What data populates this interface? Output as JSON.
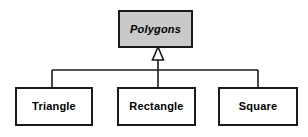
{
  "diagram": {
    "kind": "uml-class-hierarchy",
    "relationship": "generalization",
    "canvas": {
      "width": 308,
      "height": 137,
      "background": "#ffffff"
    },
    "colors": {
      "line": "#1a1a1a",
      "border": "#1a1a1a",
      "superclass_fill": "#c9c9c9",
      "subclass_fill": "#ffffff",
      "arrowhead_fill": "#ffffff",
      "text": "#000000"
    },
    "superclass": {
      "label": "Polygons",
      "abstract": true,
      "fill": "#c9c9c9"
    },
    "subclasses": [
      {
        "label": "Triangle",
        "fill": "#ffffff"
      },
      {
        "label": "Rectangle",
        "fill": "#ffffff"
      },
      {
        "label": "Square",
        "fill": "#ffffff"
      }
    ],
    "connector": {
      "arrowhead": "hollow-triangle",
      "trunk_x": 158,
      "trunk_top_y": 60,
      "bus_y": 70,
      "bus_left_x": 52,
      "bus_right_x": 258,
      "drop_x": [
        52,
        158,
        258
      ],
      "drop_bottom_y": 87
    }
  }
}
